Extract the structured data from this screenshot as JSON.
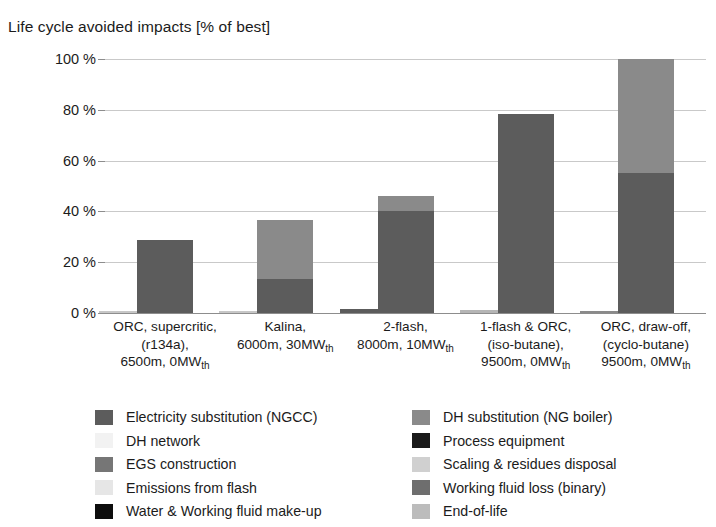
{
  "chart_data": {
    "type": "bar",
    "title": "Life cycle avoided impacts [% of best]",
    "xlabel": "",
    "ylabel": "",
    "ylim": [
      0,
      100
    ],
    "ytick_labels": [
      "100 %",
      "80 %",
      "60 %",
      "40 %",
      "20 %",
      "0 %"
    ],
    "ytick_values": [
      100,
      80,
      60,
      40,
      20,
      0
    ],
    "grid": true,
    "legend_position": "bottom",
    "stacked": true,
    "categories": [
      "ORC, supercritic, (r134a), 6500m, 0MW_th",
      "Kalina, 6000m, 30MW_th",
      "2-flash, 8000m, 10MW_th",
      "1-flash & ORC, (iso-butane), 9500m, 0MW_th",
      "ORC, draw-off, (cyclo-butane) 9500m, 0MW_th"
    ],
    "category_lines": [
      [
        "ORC, supercritic,",
        "(r134a),",
        "6500m, 0MW",
        "th"
      ],
      [
        "Kalina,",
        "6000m, 30MW",
        "th"
      ],
      [
        "2-flash,",
        "8000m, 10MW",
        "th"
      ],
      [
        "1-flash & ORC,",
        "(iso-butane),",
        "9500m, 0MW",
        "th"
      ],
      [
        "ORC, draw-off,",
        "(cyclo-butane)",
        "9500m, 0MW",
        "th"
      ]
    ],
    "series": [
      {
        "name": "Electricity substitution (NGCC)",
        "color": "#5c5c5c",
        "values": [
          28.6,
          13.5,
          40.0,
          78.5,
          55.3
        ]
      },
      {
        "name": "DH substitution (NG boiler)",
        "color": "#8a8a8a",
        "values": [
          0,
          23.0,
          6.2,
          0,
          44.7
        ]
      },
      {
        "name": "DH network",
        "color": "#f2f2f2",
        "values": [
          0,
          0,
          0,
          0,
          0
        ]
      },
      {
        "name": "Process equipment",
        "color": "#1a1a1a",
        "values": [
          0,
          0,
          0,
          0,
          0
        ]
      },
      {
        "name": "EGS construction",
        "color": "#767676",
        "values": [
          0,
          0,
          0,
          0,
          0
        ]
      },
      {
        "name": "Scaling & residues disposal",
        "color": "#d0d0d0",
        "values": [
          0,
          0,
          0,
          0,
          0
        ]
      },
      {
        "name": "Emissions from flash",
        "color": "#e6e6e6",
        "values": [
          0,
          0,
          0,
          0,
          0
        ]
      },
      {
        "name": "Working fluid loss (binary)",
        "color": "#6e6e6e",
        "values": [
          0,
          0,
          0,
          0,
          0
        ]
      },
      {
        "name": "Water & Working fluid make-up",
        "color": "#0d0d0d",
        "values": [
          0,
          0,
          0,
          0,
          0
        ]
      },
      {
        "name": "End-of-life",
        "color": "#bcbcbc",
        "values": [
          0,
          0,
          0,
          0,
          0
        ]
      }
    ],
    "secondary_bars": [
      {
        "category_index": 0,
        "value": 0.4,
        "color": "#c7c7c7"
      },
      {
        "category_index": 1,
        "value": 0.6,
        "color": "#c7c7c7"
      },
      {
        "category_index": 2,
        "value": 1.6,
        "color": "#5c5c5c"
      },
      {
        "category_index": 3,
        "value": 1.1,
        "color": "#b5b5b5"
      },
      {
        "category_index": 4,
        "value": 0.8,
        "color": "#8a8a8a"
      }
    ],
    "bar_totals": [
      28.6,
      36.5,
      46.2,
      78.5,
      100.0
    ]
  },
  "legend": {
    "left_column": [
      {
        "label": "Electricity substitution (NGCC)",
        "color": "#5c5c5c"
      },
      {
        "label": "DH network",
        "color": "#f2f2f2"
      },
      {
        "label": "EGS construction",
        "color": "#767676"
      },
      {
        "label": "Emissions from flash",
        "color": "#e6e6e6"
      },
      {
        "label": "Water & Working fluid make-up",
        "color": "#0d0d0d"
      }
    ],
    "right_column": [
      {
        "label": "DH substitution (NG boiler)",
        "color": "#8a8a8a"
      },
      {
        "label": "Process equipment",
        "color": "#1a1a1a"
      },
      {
        "label": "Scaling & residues disposal",
        "color": "#d0d0d0"
      },
      {
        "label": "Working fluid loss (binary)",
        "color": "#6e6e6e"
      },
      {
        "label": "End-of-life",
        "color": "#bcbcbc"
      }
    ]
  },
  "colors": {
    "gridline": "#c9c9c9",
    "axis": "#8d8d8d",
    "text": "#1b1b1b",
    "background": "#ffffff"
  }
}
